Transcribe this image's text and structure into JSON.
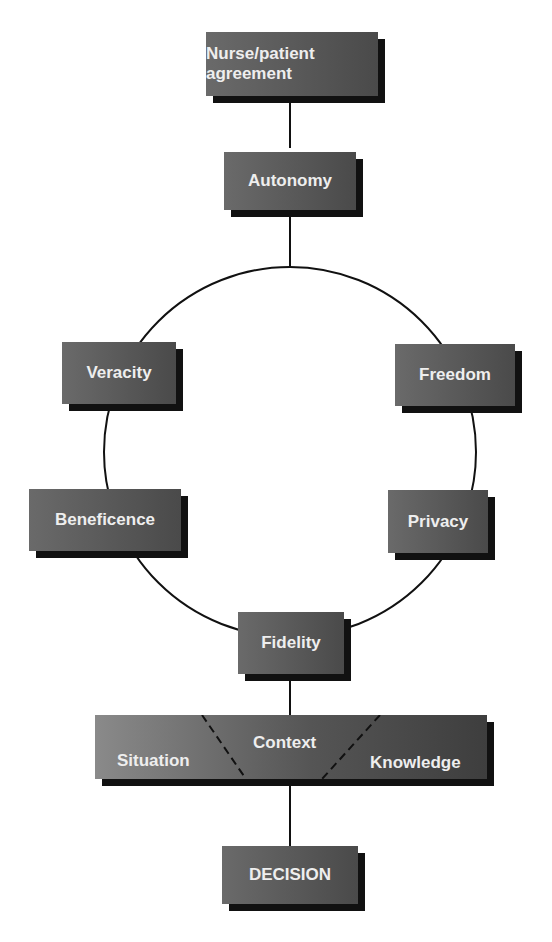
{
  "diagram": {
    "top": "Nurse/patient agreement",
    "center": "Autonomy",
    "circle_nodes": {
      "left_upper": "Veracity",
      "right_upper": "Freedom",
      "left_lower": "Beneficence",
      "right_lower": "Privacy",
      "bottom": "Fidelity"
    },
    "context_bar": {
      "left": "Situation",
      "middle": "Context",
      "right": "Knowledge"
    },
    "final": "DECISION"
  }
}
